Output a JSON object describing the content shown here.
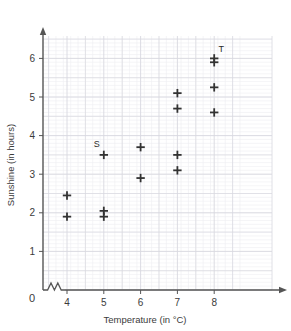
{
  "chart_data": {
    "type": "scatter",
    "title": "",
    "xlabel": "Temperature (in °C)",
    "ylabel": "Sunshine (in hours)",
    "xlim": [
      3.5,
      8.7
    ],
    "ylim": [
      0,
      6.7
    ],
    "xticks": [
      4,
      5,
      6,
      7,
      8
    ],
    "xtick_labels": [
      "4",
      "5",
      "6",
      "7",
      "8"
    ],
    "yticks": [
      0,
      1,
      2,
      3,
      4,
      5,
      6
    ],
    "ytick_labels": [
      "0",
      "1",
      "2",
      "3",
      "4",
      "5",
      "6"
    ],
    "origin_label": "0",
    "axis_break": "zigzag on x-axis between 0 and 4",
    "grid": true,
    "grid_minor_step": 0.1,
    "grid_major_step": 0.5,
    "marker": "plus",
    "marker_color": "#333333",
    "grid_color": "#d8d8e0",
    "grid_minor_color": "#eeeef2",
    "axis_color": "#555555",
    "legend": "none",
    "x": [
      4,
      4,
      5,
      5,
      5,
      6,
      6,
      7,
      7,
      7,
      7,
      8,
      8,
      8,
      8
    ],
    "y": [
      2.45,
      1.9,
      3.5,
      2.05,
      1.9,
      3.7,
      2.9,
      5.1,
      4.7,
      3.5,
      3.1,
      6.0,
      5.9,
      5.25,
      4.6
    ],
    "points": [
      {
        "x": 4,
        "y": 2.45,
        "label": ""
      },
      {
        "x": 4,
        "y": 1.9,
        "label": ""
      },
      {
        "x": 5,
        "y": 3.5,
        "label": "S"
      },
      {
        "x": 5,
        "y": 2.05,
        "label": ""
      },
      {
        "x": 5,
        "y": 1.9,
        "label": ""
      },
      {
        "x": 6,
        "y": 3.7,
        "label": ""
      },
      {
        "x": 6,
        "y": 2.9,
        "label": ""
      },
      {
        "x": 7,
        "y": 5.1,
        "label": ""
      },
      {
        "x": 7,
        "y": 4.7,
        "label": ""
      },
      {
        "x": 7,
        "y": 3.5,
        "label": ""
      },
      {
        "x": 7,
        "y": 3.1,
        "label": ""
      },
      {
        "x": 8,
        "y": 6.0,
        "label": "T"
      },
      {
        "x": 8,
        "y": 5.9,
        "label": ""
      },
      {
        "x": 8,
        "y": 5.25,
        "label": ""
      },
      {
        "x": 8,
        "y": 4.6,
        "label": ""
      }
    ],
    "annotations": [
      {
        "text": "S",
        "x": 5,
        "y": 3.5,
        "position": "above-left"
      },
      {
        "text": "T",
        "x": 8,
        "y": 6.0,
        "position": "above-right"
      }
    ]
  }
}
